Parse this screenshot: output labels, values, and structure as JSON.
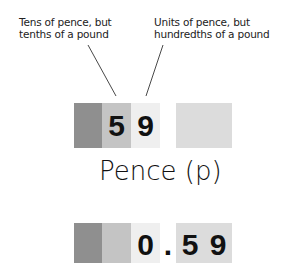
{
  "annotations": {
    "left": {
      "line1": "Tens of pence, but",
      "line2": "tenths of a pound"
    },
    "right": {
      "line1": "Units of pence, but",
      "line2": "hundredths of a pound"
    }
  },
  "top_display": {
    "digits": [
      "5",
      "9"
    ],
    "value": "59"
  },
  "unit_label": "Pence (p)",
  "bottom_display": {
    "whole": "0",
    "separator": ".",
    "digits": [
      "5",
      "9"
    ],
    "value": "0.59"
  },
  "colors": {
    "dark_column": "#8f8f8f",
    "mid_column": "#c4c4c4",
    "light_column": "#efefef",
    "right_block": "#dcdcdc"
  }
}
